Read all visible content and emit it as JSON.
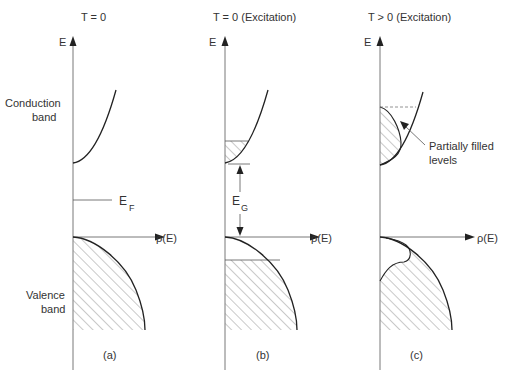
{
  "panels": [
    {
      "id": "a",
      "title": "T = 0",
      "caption": "(a)",
      "y_axis_label": "E",
      "x_axis_label": "ρ(E)",
      "conduction_label_line1": "Conduction",
      "conduction_label_line2": "band",
      "fermi_label": "E",
      "fermi_sub": "F",
      "valence_label_line1": "Valence",
      "valence_label_line2": "band"
    },
    {
      "id": "b",
      "title": "T = 0  (Excitation)",
      "caption": "(b)",
      "y_axis_label": "E",
      "x_axis_label": "ρ(E)",
      "gap_label": "E",
      "gap_sub": "G"
    },
    {
      "id": "c",
      "title": "T > 0   (Excitation)",
      "caption": "(c)",
      "y_axis_label": "E",
      "x_axis_label": "ρ(E)",
      "annotation_line1": "Partially filled",
      "annotation_line2": "levels"
    }
  ],
  "colors": {
    "line": "#222222",
    "axis": "#555555",
    "hatch": "#777777",
    "text": "#333333"
  }
}
